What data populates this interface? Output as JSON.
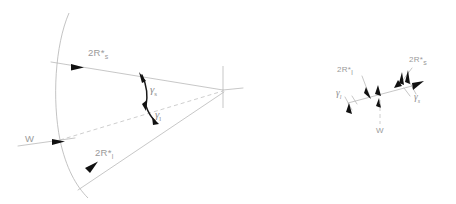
{
  "figure": {
    "colors": {
      "line": "#b9b9b9",
      "arc": "#b4b4b4",
      "dashed": "#c2c2c2",
      "arrowhead": "#111111",
      "angle_arc": "#1a1a1a",
      "label_text": "#9a9a9a",
      "background": "#ffffff"
    },
    "main_diagram": {
      "name": "wedge-fan-diagram",
      "labels": {
        "upper_ray": {
          "base": "2R*",
          "subscript": "s"
        },
        "lower_ray": {
          "base": "2R*",
          "subscript": "l"
        },
        "horizontal_ray": {
          "base": "W",
          "subscript": ""
        },
        "angle_upper": {
          "base": "γ",
          "subscript": "s"
        },
        "angle_lower": {
          "base": "γ",
          "subscript": "l"
        }
      }
    },
    "inset_diagram": {
      "name": "vector-balance-inset",
      "labels": {
        "left_vector": {
          "base": "2R*",
          "subscript": "l"
        },
        "right_vector": {
          "base": "2R*",
          "subscript": "s"
        },
        "down_vector": {
          "base": "W",
          "subscript": ""
        },
        "angle_left": {
          "base": "γ",
          "subscript": "l"
        },
        "angle_right": {
          "base": "γ",
          "subscript": "s"
        }
      }
    }
  }
}
